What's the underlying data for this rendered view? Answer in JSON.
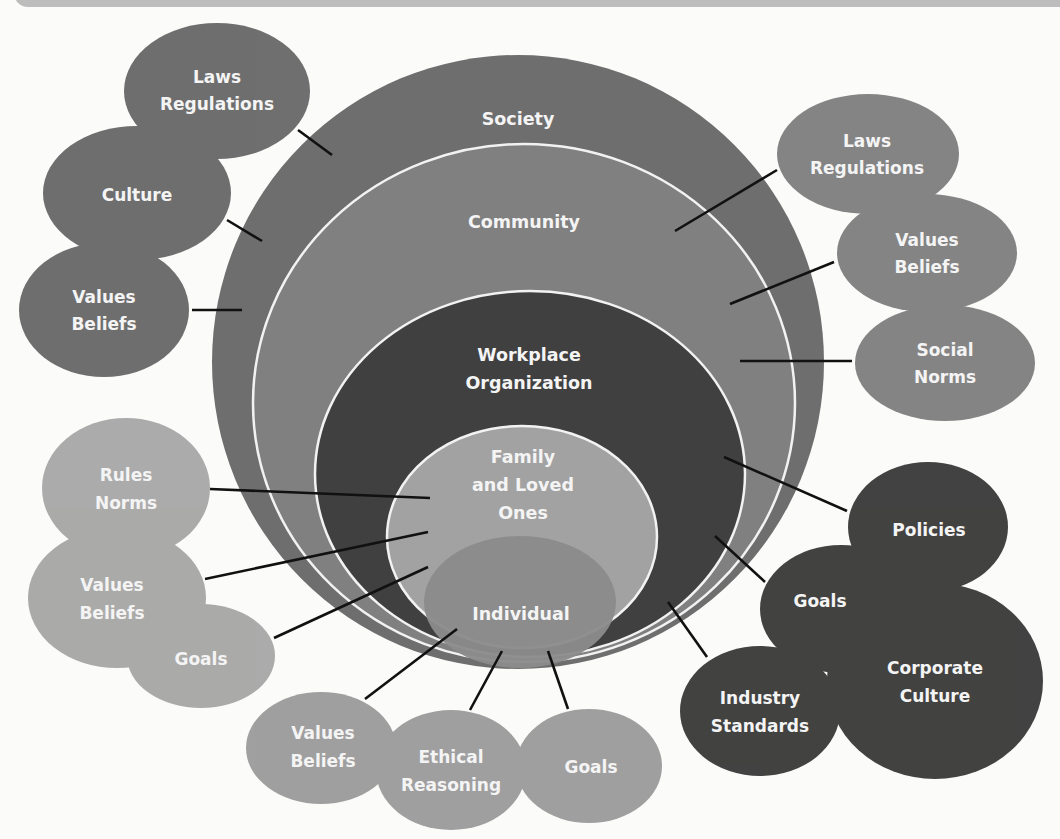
{
  "diagram": {
    "type": "nested-circles-with-influence-bubbles",
    "rings": [
      {
        "id": "society",
        "label": [
          "Society"
        ],
        "color": "#6e6e6e"
      },
      {
        "id": "community",
        "label": [
          "Community"
        ],
        "color": "#808080"
      },
      {
        "id": "workplace",
        "label": [
          "Workplace",
          "Organization"
        ],
        "color": "#404040"
      },
      {
        "id": "family",
        "label": [
          "Family",
          "and Loved",
          "Ones"
        ],
        "color": "#a2a2a2"
      },
      {
        "id": "individual",
        "label": [
          "Individual"
        ],
        "color": "#8b8b8b"
      }
    ],
    "bubbles": {
      "society": [
        {
          "label": [
            "Laws",
            "Regulations"
          ]
        },
        {
          "label": [
            "Culture"
          ]
        },
        {
          "label": [
            "Values",
            "Beliefs"
          ]
        }
      ],
      "community": [
        {
          "label": [
            "Laws",
            "Regulations"
          ]
        },
        {
          "label": [
            "Values",
            "Beliefs"
          ]
        },
        {
          "label": [
            "Social",
            "Norms"
          ]
        }
      ],
      "family": [
        {
          "label": [
            "Rules",
            "Norms"
          ]
        },
        {
          "label": [
            "Values",
            "Beliefs"
          ]
        },
        {
          "label": [
            "Goals"
          ]
        }
      ],
      "workplace": [
        {
          "label": [
            "Policies"
          ]
        },
        {
          "label": [
            "Goals"
          ]
        },
        {
          "label": [
            "Corporate",
            "Culture"
          ]
        },
        {
          "label": [
            "Industry",
            "Standards"
          ]
        }
      ],
      "individual": [
        {
          "label": [
            "Values",
            "Beliefs"
          ]
        },
        {
          "label": [
            "Ethical",
            "Reasoning"
          ]
        },
        {
          "label": [
            "Goals"
          ]
        }
      ]
    },
    "colors": {
      "society_bubbles": "#6a6a6a",
      "community_bubbles": "#818181",
      "family_bubbles": "#a6a6a6",
      "workplace_bubbles": "#3d3d3d",
      "individual_bubbles": "#9c9c9c",
      "ring_stroke": "#f2f2f2",
      "connector": "#111111",
      "background": "#fbfbfa",
      "banner": "#bdbdbd"
    }
  }
}
